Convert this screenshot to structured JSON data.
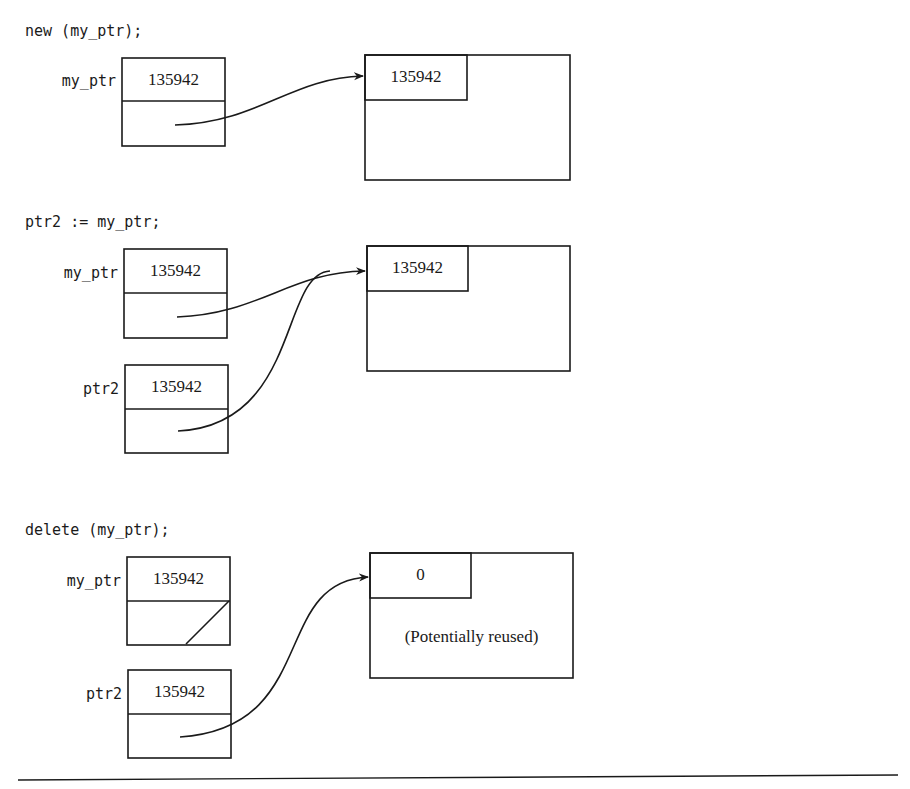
{
  "panels": [
    {
      "statement": "new (my_ptr);",
      "pointers": [
        {
          "name": "my_ptr",
          "value": "135942",
          "state": "points-to-object"
        }
      ],
      "heap_object": {
        "header_value": "135942",
        "body_text": ""
      }
    },
    {
      "statement": "ptr2 := my_ptr;",
      "pointers": [
        {
          "name": "my_ptr",
          "value": "135942",
          "state": "points-to-object"
        },
        {
          "name": "ptr2",
          "value": "135942",
          "state": "points-to-object"
        }
      ],
      "heap_object": {
        "header_value": "135942",
        "body_text": ""
      }
    },
    {
      "statement": "delete (my_ptr);",
      "pointers": [
        {
          "name": "my_ptr",
          "value": "135942",
          "state": "null"
        },
        {
          "name": "ptr2",
          "value": "135942",
          "state": "dangling"
        }
      ],
      "heap_object": {
        "header_value": "0",
        "body_text": "(Potentially reused)"
      }
    }
  ],
  "colors": {
    "stroke": "#1a1a1a",
    "background": "#ffffff"
  }
}
